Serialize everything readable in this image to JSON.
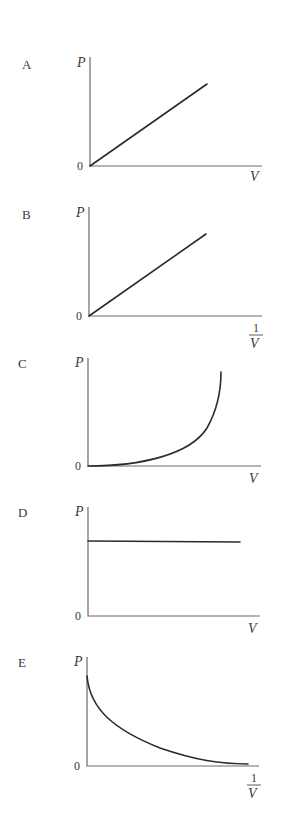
{
  "figure": {
    "zero_label": "0",
    "y_axis_label": "P"
  },
  "graphs": [
    {
      "option": "A",
      "x_label": "V",
      "x_label_fraction": false,
      "shape": "straight line through origin",
      "origin": [
        90,
        166
      ],
      "y_top": 57,
      "x_end": 262,
      "curve": "M90,166 L207,84"
    },
    {
      "option": "B",
      "x_label": "1/V",
      "x_label_fraction": true,
      "shape": "straight line through origin",
      "origin": [
        89,
        316
      ],
      "y_top": 207,
      "x_end": 262,
      "curve": "M89,316 L206,234"
    },
    {
      "option": "C",
      "x_label": "V",
      "x_label_fraction": false,
      "shape": "increasing curve, concave up, starting at origin",
      "origin": [
        88,
        466
      ],
      "y_top": 358,
      "x_end": 261,
      "curve": "M88,466 C140,466 190,455 207,428 C216,412 221,392 221,372"
    },
    {
      "option": "D",
      "x_label": "V",
      "x_label_fraction": false,
      "shape": "horizontal line (constant P)",
      "origin": [
        88,
        616
      ],
      "y_top": 507,
      "x_end": 260,
      "curve": "M88,541 L240,542"
    },
    {
      "option": "E",
      "x_label": "1/V",
      "x_label_fraction": true,
      "shape": "decreasing curve, concave up, approaching zero",
      "origin": [
        87,
        766
      ],
      "y_top": 657,
      "x_end": 259,
      "curve": "M87,676 C90,710 115,730 160,748 C195,760 220,764 248,764"
    }
  ],
  "labels": {
    "A": {
      "option": "A",
      "P": "P",
      "zero": "0",
      "x": "V"
    },
    "B": {
      "option": "B",
      "P": "P",
      "zero": "0",
      "num": "1",
      "den": "V"
    },
    "C": {
      "option": "C",
      "P": "P",
      "zero": "0",
      "x": "V"
    },
    "D": {
      "option": "D",
      "P": "P",
      "zero": "0",
      "x": "V"
    },
    "E": {
      "option": "E",
      "P": "P",
      "zero": "0",
      "num": "1",
      "den": "V"
    }
  },
  "colors": {
    "axis": "#6b6b6b",
    "curve": "#2b2b2b",
    "text": "#3a3a3a",
    "background": "#ffffff"
  }
}
